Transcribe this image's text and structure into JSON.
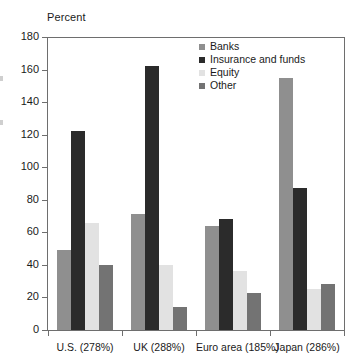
{
  "chart_data": {
    "type": "bar",
    "title": "",
    "xlabel": "",
    "ylabel": "Percent",
    "ylim": [
      0,
      180
    ],
    "ytick_step": 20,
    "yticks": [
      180,
      160,
      140,
      120,
      100,
      80,
      60,
      40,
      20,
      0
    ],
    "grid": false,
    "legend_position": "top-center-right",
    "categories": [
      "U.S. (278%)",
      "UK (288%)",
      "Euro area (185%)",
      "Japan (286%)"
    ],
    "series": [
      {
        "name": "Banks",
        "color": "#8f8f8f",
        "values": [
          49,
          71,
          64,
          155
        ]
      },
      {
        "name": "Insurance and funds",
        "color": "#2b2b2b",
        "values": [
          122,
          162,
          68,
          87
        ]
      },
      {
        "name": "Equity",
        "color": "#e2e2e2",
        "values": [
          66,
          40,
          36,
          25
        ]
      },
      {
        "name": "Other",
        "color": "#737373",
        "values": [
          40,
          14,
          23,
          28
        ]
      }
    ]
  },
  "axis": {
    "y_title": "Percent"
  },
  "colors": {
    "axis_line": "#6e6e6e",
    "text": "#1a1a1a",
    "background": "#ffffff"
  }
}
